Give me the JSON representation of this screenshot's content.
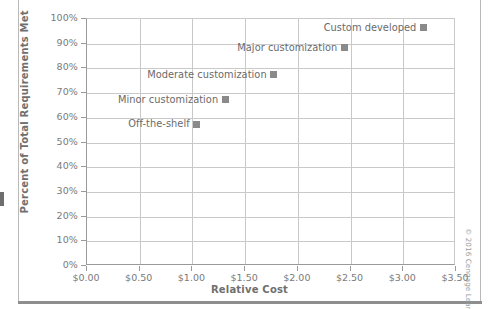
{
  "chart_data": {
    "type": "scatter",
    "title": "",
    "xlabel": "Relative Cost",
    "ylabel": "Percent of Total Requirements Met",
    "xlim": [
      0.0,
      3.5
    ],
    "ylim": [
      0,
      100
    ],
    "grid": true,
    "legend": "none",
    "xticks": [
      "$0.00",
      "$0.50",
      "$1.00",
      "$1.50",
      "$2.00",
      "$2.50",
      "$3.00",
      "$3.50"
    ],
    "xtick_values": [
      0.0,
      0.5,
      1.0,
      1.5,
      2.0,
      2.5,
      3.0,
      3.5
    ],
    "yticks": [
      "0%",
      "10%",
      "20%",
      "30%",
      "40%",
      "50%",
      "60%",
      "70%",
      "80%",
      "90%",
      "100%"
    ],
    "ytick_values": [
      0,
      10,
      20,
      30,
      40,
      50,
      60,
      70,
      80,
      90,
      100
    ],
    "marker_color": "#8a8a8a",
    "points": [
      {
        "label": "Off-the-shelf",
        "x": 1.05,
        "y": 57
      },
      {
        "label": "Minor customization",
        "x": 1.32,
        "y": 67
      },
      {
        "label": "Moderate customization",
        "x": 1.78,
        "y": 77
      },
      {
        "label": "Major customization",
        "x": 2.45,
        "y": 88
      },
      {
        "label": "Custom developed",
        "x": 3.2,
        "y": 96
      }
    ]
  },
  "credit": "© 2016 Cengage Learning"
}
